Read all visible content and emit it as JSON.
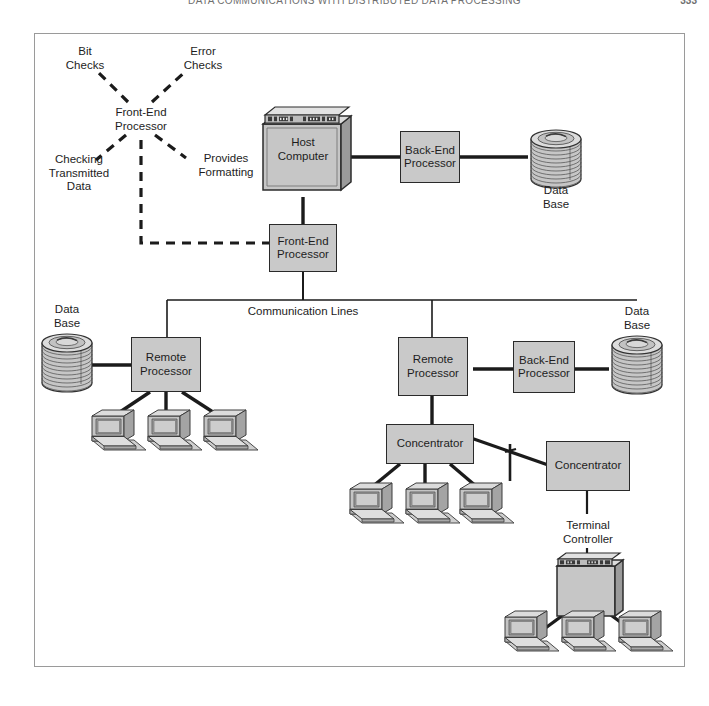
{
  "page": {
    "running_head": "DATA COMMUNICATIONS WITH DISTRIBUTED DATA PROCESSING",
    "folio": "333"
  },
  "figure": {
    "title": "",
    "annotation_hub": "Front-End\nProcessor",
    "annotations": [
      {
        "name": "bit-checks",
        "label": "Bit\nChecks"
      },
      {
        "name": "error-checks",
        "label": "Error\nChecks"
      },
      {
        "name": "checking-transmitted",
        "label": "Checking\nTransmitted\nData"
      },
      {
        "name": "provides-formatting",
        "label": "Provides\nFormatting"
      }
    ],
    "bus_label": "Communication Lines",
    "nodes": [
      {
        "name": "host-computer",
        "label": "Host\nComputer"
      },
      {
        "name": "back-end-processor-top",
        "label": "Back-End\nProcessor"
      },
      {
        "name": "database-top-right",
        "label": "Data\nBase"
      },
      {
        "name": "front-end-processor",
        "label": "Front-End\nProcessor"
      },
      {
        "name": "database-left",
        "label": "Data\nBase"
      },
      {
        "name": "remote-processor-left",
        "label": "Remote\nProcessor"
      },
      {
        "name": "remote-processor-right",
        "label": "Remote\nProcessor"
      },
      {
        "name": "back-end-processor-right",
        "label": "Back-End\nProcessor"
      },
      {
        "name": "database-right",
        "label": "Data\nBase"
      },
      {
        "name": "concentrator-left",
        "label": "Concentrator"
      },
      {
        "name": "concentrator-right",
        "label": "Concentrator"
      },
      {
        "name": "terminal-controller",
        "label": "Terminal\nController"
      }
    ],
    "terminal_groups": [
      {
        "name": "terminals-remote-left",
        "count": 3
      },
      {
        "name": "terminals-concentrator-left",
        "count": 3
      },
      {
        "name": "terminals-controller",
        "count": 3
      }
    ],
    "colors": {
      "box_fill": "#c9c9c9",
      "box_stroke": "#2a2a2a",
      "link": "#1b1b1b",
      "frame": "#9a9a9a",
      "device_light": "#d9d9d9",
      "device_mid": "#b9b9b9",
      "device_dark": "#8f8f8f",
      "screen": "#c2c2c2"
    }
  }
}
